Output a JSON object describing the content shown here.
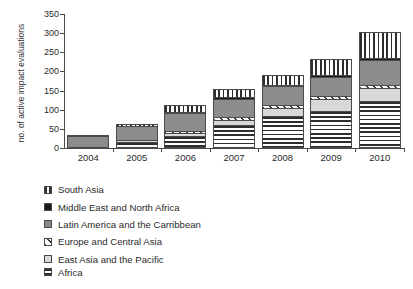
{
  "chart_data": {
    "type": "bar",
    "subtype": "stacked-vertical",
    "title": "",
    "xlabel": "",
    "ylabel": "no. of active impact evaluations",
    "categories": [
      "2004",
      "2005",
      "2006",
      "2007",
      "2008",
      "2009",
      "2010"
    ],
    "ylim": [
      0,
      350
    ],
    "yticks": [
      0,
      50,
      100,
      150,
      200,
      250,
      300,
      350
    ],
    "grid": false,
    "legend_position": "below",
    "stack_order_bottom_to_top": [
      "Africa",
      "East Asia and the Pacific",
      "Europe and Central Asia",
      "Latin America and the Carribbean",
      "Middle East and North Africa",
      "South Asia"
    ],
    "series": [
      {
        "name": "Africa",
        "pattern": "horizontal-stripes",
        "color": "#2e2e2e",
        "values": [
          0,
          12,
          27,
          58,
          80,
          95,
          120
        ]
      },
      {
        "name": "East Asia and the Pacific",
        "pattern": "solid-light-gray",
        "color": "#d8d8d8",
        "values": [
          0,
          4,
          10,
          12,
          22,
          32,
          35
        ]
      },
      {
        "name": "Europe and Central Asia",
        "pattern": "diagonal-hatch",
        "color": "#3a3a3a",
        "values": [
          0,
          0,
          5,
          8,
          8,
          8,
          8
        ]
      },
      {
        "name": "Latin America and the Carribbean",
        "pattern": "solid-medium-gray",
        "color": "#8c8c8c",
        "values": [
          30,
          40,
          50,
          50,
          50,
          50,
          65
        ]
      },
      {
        "name": "Middle East and North Africa",
        "pattern": "solid-black",
        "color": "#1b1b1b",
        "values": [
          0,
          0,
          2,
          5,
          5,
          6,
          6
        ]
      },
      {
        "name": "South Asia",
        "pattern": "vertical-stripes",
        "color": "#2e2e2e",
        "values": [
          4,
          6,
          18,
          20,
          25,
          42,
          68
        ]
      }
    ],
    "totals": [
      34,
      62,
      112,
      153,
      190,
      233,
      302
    ]
  },
  "legend": {
    "items": [
      {
        "label": "South Asia",
        "swatch": "vertical-stripes-swatch"
      },
      {
        "label": "Middle East and North Africa",
        "swatch": "solid-black-swatch"
      },
      {
        "label": "Latin America and the Carribbean",
        "swatch": "solid-medium-gray-swatch"
      },
      {
        "label": "Europe and Central Asia",
        "swatch": "diagonal-hatch-swatch"
      },
      {
        "label": "East Asia and the Pacific",
        "swatch": "solid-light-gray-swatch"
      },
      {
        "label": "Africa",
        "swatch": "horizontal-stripes-swatch"
      }
    ]
  }
}
